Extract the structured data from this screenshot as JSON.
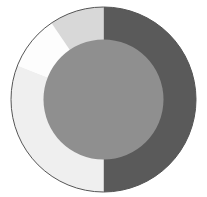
{
  "title": "",
  "chart_data": {
    "type": "pie",
    "title": "",
    "variant": "donut-with-filled-center",
    "center": [
      103.5,
      99.5
    ],
    "outer_radius": 92.5,
    "inner_radius": 60,
    "start_angle_deg": 0,
    "direction": "clockwise",
    "slices": [
      {
        "label": "",
        "value": 50,
        "color": "#5a5a5a"
      },
      {
        "label": "",
        "value": 31,
        "color": "#efefef"
      },
      {
        "label": "",
        "value": 9.5,
        "color": "#fdfdfd"
      },
      {
        "label": "",
        "value": 9.5,
        "color": "#d8d8d8"
      }
    ],
    "center_fill": "#8f8f8f",
    "outline_color": "#555555",
    "legend": "none"
  }
}
